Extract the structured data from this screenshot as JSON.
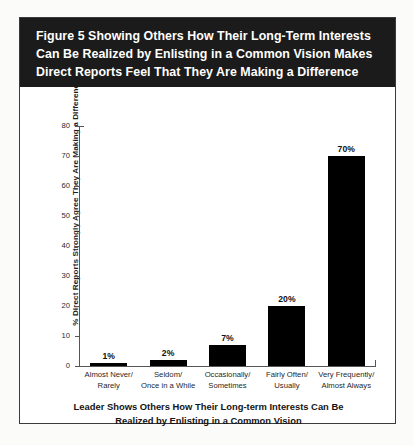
{
  "figure": {
    "title_lines": [
      "Figure 5  Showing Others How Their Long-Term Interests",
      "Can Be Realized by Enlisting in a Common Vision Makes",
      "Direct Reports Feel That They Are Making a Difference"
    ],
    "banner_color": "#1b1b1b",
    "banner_text_color": "#ffffff",
    "frame_color": "#3a3a3a",
    "page_background": "#fbfbf9"
  },
  "chart_data": {
    "type": "bar",
    "title": "Figure 5  Showing Others How Their Long-Term Interests Can Be Realized by Enlisting in a Common Vision Makes Direct Reports Feel That They Are Making a Difference",
    "categories": [
      "Almost Never/ Rarely",
      "Seldom/ Once in a While",
      "Occasionally/ Sometimes",
      "Fairly Often/ Usually",
      "Very Frequently/ Almost Always"
    ],
    "category_lines": [
      [
        "Almost Never/",
        "Rarely"
      ],
      [
        "Seldom/",
        "Once in a While"
      ],
      [
        "Occasionally/",
        "Sometimes"
      ],
      [
        "Fairly Often/",
        "Usually"
      ],
      [
        "Very Frequently/",
        "Almost Always"
      ]
    ],
    "values": [
      1,
      2,
      7,
      20,
      70
    ],
    "data_labels": [
      "1%",
      "2%",
      "7%",
      "20%",
      "70%"
    ],
    "ylabel_lines": [
      "% Direct Reports Strongly Agree They Are Making",
      "a Difference"
    ],
    "ylabel": "% Direct Reports Strongly Agree They Are Making a Difference",
    "xlabel_lines": [
      "Leader Shows Others How Their Long-term Interests Can Be",
      "Realized by Enlisting in a Common Vision"
    ],
    "xlabel": "Leader Shows Others How Their Long-term Interests Can Be Realized by Enlisting in a Common Vision",
    "ylim": [
      0,
      80
    ],
    "yticks": [
      0,
      10,
      20,
      30,
      40,
      50,
      60,
      70,
      80
    ],
    "ytick_labels": [
      "0",
      "10",
      "20",
      "30",
      "40",
      "50",
      "60",
      "70",
      "80"
    ],
    "grid": false,
    "legend": null,
    "bar_color": "#000000",
    "axis_color": "#555555"
  }
}
